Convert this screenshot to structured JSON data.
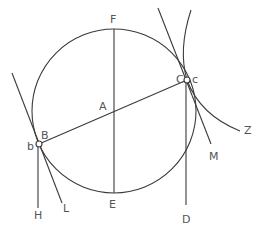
{
  "diagram": {
    "title": "",
    "labels": {
      "F": "F",
      "A": "A",
      "E": "E",
      "B": "B",
      "b": "b",
      "C": "C",
      "c": "c",
      "H": "H",
      "L": "L",
      "D": "D",
      "M": "M",
      "Z": "Z"
    },
    "points": {
      "A": {
        "x": 114,
        "y": 111,
        "role": "circle center"
      },
      "F": {
        "x": 114,
        "y": 29,
        "role": "top of circle"
      },
      "E": {
        "x": 114,
        "y": 193,
        "role": "bottom of circle"
      },
      "B": {
        "x": 39,
        "y": 144,
        "role": "point on circle (left)"
      },
      "C": {
        "x": 187,
        "y": 80,
        "role": "point on circle (right)"
      }
    },
    "elements": [
      "circle centered at A through F, E, B, C",
      "vertical diameter FE through A",
      "diameter BC through A",
      "tangent line at B (upper-left to L)",
      "vertical line from B down to H",
      "tangent line at C (top to M)",
      "vertical line from C down to D",
      "curve through C ending at Z"
    ],
    "colors": {
      "stroke": "#3a3a3a",
      "label": "#555555",
      "background": "#ffffff"
    }
  }
}
